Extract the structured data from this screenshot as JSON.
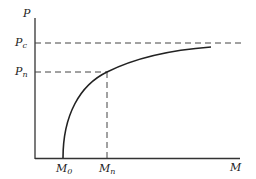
{
  "diagram": {
    "axes": {
      "y_label": "P",
      "x_label": "M"
    },
    "y_markers": [
      {
        "base": "P",
        "sub": "c"
      },
      {
        "base": "P",
        "sub": "n"
      }
    ],
    "x_markers": [
      {
        "base": "M",
        "sub": "0"
      },
      {
        "base": "M",
        "sub": "n"
      }
    ],
    "colors": {
      "line": "#222222",
      "background": "#ffffff"
    }
  }
}
